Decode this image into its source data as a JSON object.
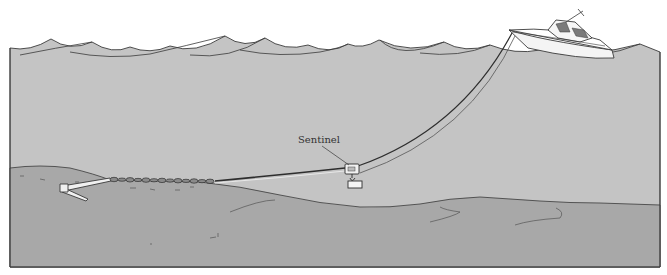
{
  "figure": {
    "labels": {
      "sentinel": "Sentinel"
    },
    "components": [
      "waves",
      "boat",
      "anchor-rode",
      "sentinel",
      "sentinel-weight",
      "chain",
      "anchor",
      "seabed"
    ],
    "colors": {
      "water": "#c4c4c4",
      "seabed": "#a8a8a8",
      "line": "#3a3a3a",
      "hull": "#f4f4f4",
      "cabin_window": "#7a7a7a",
      "background": "#ffffff"
    }
  }
}
